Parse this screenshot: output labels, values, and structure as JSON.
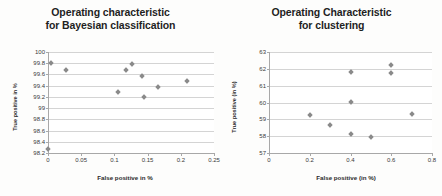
{
  "charts": [
    {
      "id": "bayesian",
      "title_line1": "Operating characteristic",
      "title_line2": "for Bayesian classification",
      "xlabel": "False positive in %",
      "ylabel": "True positive in %",
      "chart_data": {
        "type": "scatter",
        "title": "Operating characteristic for Bayesian classification",
        "xlabel": "False positive in %",
        "ylabel": "True positive in %",
        "xlim": [
          0,
          0.25
        ],
        "ylim": [
          98.2,
          100
        ],
        "xticks": [
          "0",
          "0.05",
          "0.1",
          "0.15",
          "0.2",
          "0.25"
        ],
        "yticks": [
          "100",
          "99.8",
          "99.6",
          "99.4",
          "99.2",
          "99",
          "98.8",
          "98.6",
          "98.4",
          "98.2"
        ],
        "grid": true,
        "legend": "none",
        "points": [
          {
            "x": 0.0,
            "y": 98.27
          },
          {
            "x": 0.005,
            "y": 99.8
          },
          {
            "x": 0.027,
            "y": 99.68
          },
          {
            "x": 0.105,
            "y": 99.29
          },
          {
            "x": 0.118,
            "y": 99.68
          },
          {
            "x": 0.127,
            "y": 99.79
          },
          {
            "x": 0.142,
            "y": 99.58
          },
          {
            "x": 0.145,
            "y": 99.19
          },
          {
            "x": 0.165,
            "y": 99.38
          },
          {
            "x": 0.21,
            "y": 99.48
          }
        ]
      }
    },
    {
      "id": "clustering",
      "title_line1": "Operating Characteristic",
      "title_line2": "for clustering",
      "xlabel": "False positive (in %)",
      "ylabel": "True positive (in %)",
      "chart_data": {
        "type": "scatter",
        "title": "Operating Characteristic for clustering",
        "xlabel": "False positive (in %)",
        "ylabel": "True positive (in %)",
        "xlim": [
          0,
          0.8
        ],
        "ylim": [
          57,
          63
        ],
        "xticks": [
          "0",
          "0.2",
          "0.4",
          "0.6",
          "0.8"
        ],
        "yticks": [
          "63",
          "62",
          "61",
          "60",
          "59",
          "58",
          "57"
        ],
        "grid": true,
        "legend": "none",
        "points": [
          {
            "x": 0.2,
            "y": 59.25
          },
          {
            "x": 0.3,
            "y": 58.67
          },
          {
            "x": 0.4,
            "y": 58.15
          },
          {
            "x": 0.4,
            "y": 60.05
          },
          {
            "x": 0.4,
            "y": 61.8
          },
          {
            "x": 0.5,
            "y": 57.95
          },
          {
            "x": 0.6,
            "y": 61.75
          },
          {
            "x": 0.6,
            "y": 62.25
          },
          {
            "x": 0.7,
            "y": 59.3
          }
        ]
      }
    }
  ]
}
